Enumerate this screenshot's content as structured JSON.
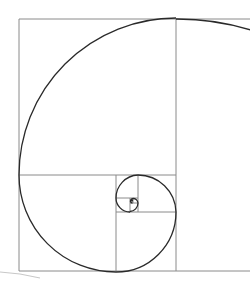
{
  "diagram": {
    "type": "fibonacci-spiral",
    "colors": {
      "background": "#ffffff",
      "grid": "#8a8a8a",
      "spiral": "#2a2a2a"
    },
    "squares": [
      {
        "x": 176,
        "y": 19,
        "size": 252
      },
      {
        "x": 19,
        "y": 19,
        "size": 157
      },
      {
        "x": 19,
        "y": 175,
        "size": 97
      },
      {
        "x": 116,
        "y": 212,
        "size": 60
      },
      {
        "x": 138,
        "y": 175,
        "size": 37
      },
      {
        "x": 116,
        "y": 175,
        "size": 22
      },
      {
        "x": 116,
        "y": 198,
        "size": 14
      },
      {
        "x": 130,
        "y": 203,
        "size": 8
      },
      {
        "x": 133,
        "y": 198,
        "size": 5
      }
    ]
  }
}
